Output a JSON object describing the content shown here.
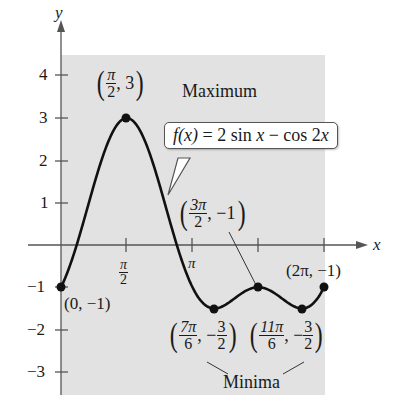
{
  "chart_data": {
    "type": "line",
    "title": "",
    "function_label": "f(x) = 2 sin x − cos 2x",
    "xlabel": "x",
    "ylabel": "y",
    "xlim": [
      0,
      6.2832
    ],
    "ylim": [
      -3.3,
      4.5
    ],
    "x_ticks": [
      {
        "value": 1.5708,
        "label": "π/2"
      },
      {
        "value": 3.1416,
        "label": "π"
      },
      {
        "value": 4.7124,
        "label": ""
      },
      {
        "value": 6.2832,
        "label": ""
      }
    ],
    "y_ticks": [
      {
        "value": 4,
        "label": "4"
      },
      {
        "value": 3,
        "label": "3"
      },
      {
        "value": 2,
        "label": "2"
      },
      {
        "value": 1,
        "label": "1"
      },
      {
        "value": -1,
        "label": "−1"
      },
      {
        "value": -2,
        "label": "−2"
      },
      {
        "value": -3,
        "label": "−3"
      }
    ],
    "grid": false,
    "shaded_region": {
      "x": [
        0,
        6.2832
      ],
      "y": [
        -3.3,
        4.5
      ]
    },
    "series": [
      {
        "name": "f(x) = 2 sin x − cos 2x",
        "x": [
          0,
          0.5236,
          1.0472,
          1.5708,
          2.0944,
          2.618,
          3.1416,
          3.6652,
          4.1888,
          4.7124,
          5.236,
          5.7596,
          6.2832
        ],
        "values": [
          -1,
          0.5,
          1.232,
          3,
          1.232,
          0.5,
          -1,
          -1.5,
          -1.232,
          -1,
          -1.232,
          -1.5,
          -1
        ]
      }
    ],
    "key_points": [
      {
        "x": 0,
        "y": -1,
        "label": "(0, −1)"
      },
      {
        "x": 1.5708,
        "y": 3,
        "label": "(π/2, 3)",
        "annotation": "Maximum"
      },
      {
        "x": 3.6652,
        "y": -1.5,
        "label": "(7π/6, −3/2)",
        "annotation": "Minima"
      },
      {
        "x": 4.7124,
        "y": -1,
        "label": "(3π/2, −1)"
      },
      {
        "x": 5.7596,
        "y": -1.5,
        "label": "(11π/6, −3/2)",
        "annotation": "Minima"
      },
      {
        "x": 6.2832,
        "y": -1,
        "label": "(2π, −1)"
      }
    ],
    "annotations": [
      "Maximum",
      "Minima"
    ]
  },
  "labels": {
    "axis_x": "x",
    "axis_y": "y",
    "tick_pi": "π",
    "tick_pi_half_num": "π",
    "tick_pi_half_den": "2",
    "y4": "4",
    "y3": "3",
    "y2": "2",
    "y1": "1",
    "ym1": "−1",
    "ym2": "−2",
    "ym3": "−3",
    "max_num": "π",
    "max_den": "2",
    "max_y": ", 3",
    "max_text": "Maximum",
    "eq_lhs": "f(x)",
    "eq_rhs": " = 2 sin ",
    "eq_x": "x",
    "eq_minus": " − cos 2",
    "eq_x2": "x",
    "origin_pt": "(0, −1)",
    "p3_num": "3π",
    "p3_den": "2",
    "p3_y": ", −1",
    "end_pt": "(2π, −1)",
    "min1_num": "7π",
    "min1_den": "6",
    "min1_sep": ", −",
    "min1_ynum": "3",
    "min1_yden": "2",
    "min2_num": "11π",
    "min2_den": "6",
    "min2_sep": ", −",
    "min2_ynum": "3",
    "min2_yden": "2",
    "minima_text": "Minima"
  }
}
